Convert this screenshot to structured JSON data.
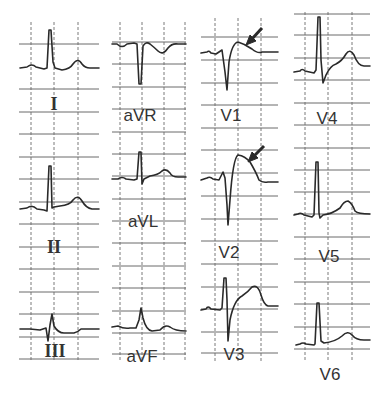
{
  "figure": {
    "type": "12-lead electrocardiogram",
    "layout": "4 columns x 3 rows",
    "colors": {
      "trace": "#2a2a2a",
      "grid": "#6a6a6a",
      "background": "#ffffff"
    }
  },
  "leads": [
    {
      "id": "I",
      "label": "I",
      "column": 1,
      "row": 1
    },
    {
      "id": "II",
      "label": "II",
      "column": 1,
      "row": 2
    },
    {
      "id": "III",
      "label": "III",
      "column": 1,
      "row": 3
    },
    {
      "id": "aVR",
      "label": "aVR",
      "column": 2,
      "row": 1
    },
    {
      "id": "aVL",
      "label": "aVL",
      "column": 2,
      "row": 2
    },
    {
      "id": "aVF",
      "label": "aVF",
      "column": 2,
      "row": 3
    },
    {
      "id": "V1",
      "label": "V1",
      "column": 3,
      "row": 1,
      "annotation": "arrow-st-elevation"
    },
    {
      "id": "V2",
      "label": "V2",
      "column": 3,
      "row": 2,
      "annotation": "arrow-st-elevation"
    },
    {
      "id": "V3",
      "label": "V3",
      "column": 3,
      "row": 3
    },
    {
      "id": "V4",
      "label": "V4",
      "column": 4,
      "row": 1
    },
    {
      "id": "V5",
      "label": "V5",
      "column": 4,
      "row": 2
    },
    {
      "id": "V6",
      "label": "V6",
      "column": 4,
      "row": 3
    }
  ],
  "annotations": [
    {
      "lead": "V1",
      "type": "arrow",
      "points_to": "ST segment / T wave"
    },
    {
      "lead": "V2",
      "type": "arrow",
      "points_to": "ST segment / T wave"
    }
  ]
}
